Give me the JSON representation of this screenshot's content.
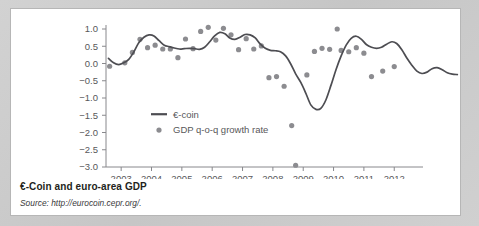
{
  "figure": {
    "caption_title": "€-Coin and euro-area GDP",
    "caption_source": "Source: http://eurocoin.cepr.org/."
  },
  "chart_data": {
    "type": "line",
    "title": "€-Coin and euro-area GDP",
    "xlabel": "",
    "ylabel": "",
    "xlim": [
      2002.5,
      2012.75
    ],
    "ylim": [
      -3.0,
      1.0
    ],
    "grid": false,
    "legend_position": "inside-left",
    "y_ticks": [
      "1.0",
      "0.5",
      "0.0",
      "-0.5",
      "-1.0",
      "-1.5",
      "-2.0",
      "-2.5",
      "-3.0"
    ],
    "y_tick_values": [
      1.0,
      0.5,
      0.0,
      -0.5,
      -1.0,
      -1.5,
      -2.0,
      -2.5,
      -3.0
    ],
    "x_ticks": [
      "2003",
      "2004",
      "2005",
      "2006",
      "2007",
      "2008",
      "2009",
      "2010",
      "2011",
      "2012"
    ],
    "x_tick_values": [
      2003,
      2004,
      2005,
      2006,
      2007,
      2008,
      2009,
      2010,
      2011,
      2012
    ],
    "series": [
      {
        "name": "€-coin",
        "type": "line",
        "color": "#4d4d52",
        "x": [
          2002.58,
          2002.75,
          2002.92,
          2003.08,
          2003.25,
          2003.42,
          2003.58,
          2003.75,
          2003.92,
          2004.08,
          2004.25,
          2004.42,
          2004.58,
          2004.75,
          2004.92,
          2005.08,
          2005.25,
          2005.42,
          2005.58,
          2005.75,
          2005.92,
          2006.08,
          2006.25,
          2006.42,
          2006.58,
          2006.75,
          2006.92,
          2007.08,
          2007.25,
          2007.42,
          2007.58,
          2007.75,
          2007.92,
          2008.08,
          2008.25,
          2008.42,
          2008.58,
          2008.75,
          2008.92,
          2009.08,
          2009.25,
          2009.42,
          2009.58,
          2009.75,
          2009.92,
          2010.08,
          2010.25,
          2010.42,
          2010.58,
          2010.75,
          2010.92,
          2011.08,
          2011.25,
          2011.42,
          2011.58,
          2011.75,
          2011.92,
          2012.08,
          2012.25,
          2012.42,
          2012.58
        ],
        "y": [
          0.15,
          0.02,
          -0.03,
          0.02,
          0.12,
          0.34,
          0.6,
          0.76,
          0.83,
          0.8,
          0.66,
          0.53,
          0.49,
          0.45,
          0.42,
          0.43,
          0.44,
          0.43,
          0.41,
          0.47,
          0.63,
          0.8,
          0.9,
          0.86,
          0.74,
          0.7,
          0.76,
          0.84,
          0.83,
          0.74,
          0.57,
          0.44,
          0.38,
          0.37,
          0.34,
          0.22,
          0.0,
          -0.3,
          -0.55,
          -0.85,
          -1.2,
          -1.33,
          -1.3,
          -1.05,
          -0.62,
          -0.18,
          0.22,
          0.54,
          0.73,
          0.79,
          0.7,
          0.55,
          0.47,
          0.44,
          0.47,
          0.56,
          0.63,
          0.58,
          0.4,
          0.15,
          -0.05
        ],
        "y_tail": [
          -0.22,
          -0.29,
          -0.25,
          -0.15,
          -0.12,
          -0.18,
          -0.27,
          -0.31,
          -0.32
        ]
      },
      {
        "name": "GDP q-o-q growth rate",
        "type": "scatter",
        "color": "#8c8c90",
        "points": [
          {
            "x": 2002.62,
            "y": -0.08
          },
          {
            "x": 2003.12,
            "y": 0.02
          },
          {
            "x": 2003.37,
            "y": 0.32
          },
          {
            "x": 2003.62,
            "y": 0.7
          },
          {
            "x": 2003.87,
            "y": 0.46
          },
          {
            "x": 2004.12,
            "y": 0.53
          },
          {
            "x": 2004.37,
            "y": 0.42
          },
          {
            "x": 2004.62,
            "y": 0.42
          },
          {
            "x": 2004.87,
            "y": 0.17
          },
          {
            "x": 2005.12,
            "y": 0.71
          },
          {
            "x": 2005.37,
            "y": 0.43
          },
          {
            "x": 2005.62,
            "y": 0.93
          },
          {
            "x": 2005.87,
            "y": 1.05
          },
          {
            "x": 2006.12,
            "y": 0.68
          },
          {
            "x": 2006.37,
            "y": 1.02
          },
          {
            "x": 2006.62,
            "y": 0.83
          },
          {
            "x": 2006.87,
            "y": 0.4
          },
          {
            "x": 2007.12,
            "y": 0.72
          },
          {
            "x": 2007.37,
            "y": 0.42
          },
          {
            "x": 2007.62,
            "y": 0.51
          },
          {
            "x": 2007.87,
            "y": -0.41
          },
          {
            "x": 2008.12,
            "y": -0.38
          },
          {
            "x": 2008.37,
            "y": -0.66
          },
          {
            "x": 2008.62,
            "y": -1.8
          },
          {
            "x": 2008.75,
            "y": -2.95
          },
          {
            "x": 2009.12,
            "y": -0.33
          },
          {
            "x": 2009.37,
            "y": 0.35
          },
          {
            "x": 2009.62,
            "y": 0.44
          },
          {
            "x": 2009.87,
            "y": 0.41
          },
          {
            "x": 2010.12,
            "y": 1.0
          },
          {
            "x": 2010.25,
            "y": 0.38
          },
          {
            "x": 2010.5,
            "y": 0.34
          },
          {
            "x": 2010.75,
            "y": 0.46
          },
          {
            "x": 2011.0,
            "y": 0.3
          },
          {
            "x": 2011.25,
            "y": -0.38
          },
          {
            "x": 2011.62,
            "y": -0.22
          },
          {
            "x": 2012.0,
            "y": -0.09
          }
        ]
      }
    ]
  }
}
